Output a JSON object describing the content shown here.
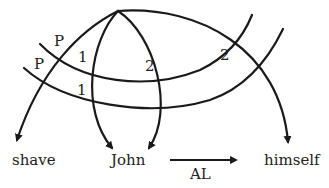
{
  "diagram": {
    "nodes": [
      {
        "id": "shave",
        "label": "shave"
      },
      {
        "id": "john",
        "label": "John"
      },
      {
        "id": "himself",
        "label": "himself"
      }
    ],
    "arc_labels": {
      "p_upper": "P",
      "p_lower": "P",
      "one_upper": "1",
      "one_lower": "1",
      "two_left": "2",
      "two_right": "2"
    },
    "relation": {
      "label": "AL",
      "from": "John",
      "to": "himself"
    },
    "colors": {
      "stroke": "#1a1a1a",
      "text": "#222222",
      "background": "#ffffff"
    }
  }
}
